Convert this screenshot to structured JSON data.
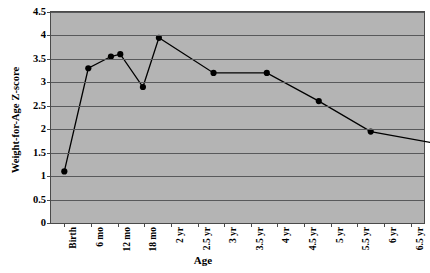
{
  "chart_data": {
    "type": "line",
    "title": "",
    "xlabel": "Age",
    "ylabel": "Weight-for-Age Z-score",
    "ylabel_line1": "Weight-for-Age",
    "ylabel_line2": "Z-score",
    "categories": [
      "Birth",
      "6 mo",
      "12 mo",
      "18 mo",
      "2 yr",
      "2.5 yr",
      "3 yr",
      "3.5 yr",
      "4 yr",
      "4.5 yr",
      "5 yr",
      "5.5 yr",
      "6 yr",
      "6.5 yr"
    ],
    "values": [
      1.1,
      3.3,
      3.55,
      3.6,
      2.9,
      3.95,
      null,
      3.2,
      null,
      3.2,
      null,
      2.6,
      null,
      1.95
    ],
    "points": [
      {
        "category": "Birth",
        "x_index": 0.0,
        "value": 1.1
      },
      {
        "category": "between Birth and 6 mo",
        "x_index": 0.9,
        "value": 3.3
      },
      {
        "category": "6 mo",
        "x_index": 1.75,
        "value": 3.55
      },
      {
        "category": "6 mo+",
        "x_index": 2.1,
        "value": 3.6
      },
      {
        "category": "12 mo",
        "x_index": 2.95,
        "value": 2.9
      },
      {
        "category": "12 mo+",
        "x_index": 3.55,
        "value": 3.95
      },
      {
        "category": "2 yr",
        "x_index": 5.6,
        "value": 3.2
      },
      {
        "category": "3 yr",
        "x_index": 7.6,
        "value": 3.2
      },
      {
        "category": "4 yr",
        "x_index": 9.55,
        "value": 2.6
      },
      {
        "category": "5 yr",
        "x_index": 11.5,
        "value": 1.95
      },
      {
        "category": "6.5 yr",
        "x_index": 13.9,
        "value": 1.7
      }
    ],
    "yticks": [
      0,
      0.5,
      1,
      1.5,
      2,
      2.5,
      3,
      3.5,
      4,
      4.5
    ],
    "ytick_labels": [
      "0",
      "0.5",
      "1",
      "1.5",
      "2",
      "2.5",
      "3",
      "3.5",
      "4",
      "4.5"
    ],
    "ylim": [
      0,
      4.5
    ],
    "xlim": [
      0,
      14
    ],
    "grid": true,
    "legend": "none",
    "plot_background_color": "#b4b4b4",
    "gridline_color": "#58595b",
    "series_color": "#000000",
    "marker": "circle",
    "marker_color": "#000000"
  }
}
